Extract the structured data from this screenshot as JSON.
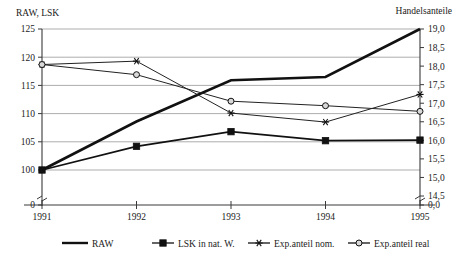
{
  "chart_data": {
    "type": "line",
    "title": "",
    "xlabel": "",
    "ylabel": "RAW, LSK",
    "y2label": "Handelsanteile",
    "grid": true,
    "legend_position": "bottom",
    "categories": [
      "1991",
      "1992",
      "1993",
      "1994",
      "1995"
    ],
    "ylim": [
      100,
      125
    ],
    "y2lim": [
      14.5,
      19.0
    ],
    "yticks": [
      "0",
      "100",
      "105",
      "110",
      "115",
      "120",
      "125"
    ],
    "y2ticks": [
      "0,0",
      "14,5",
      "15,0",
      "15,5",
      "16,0",
      "16,5",
      "17,0",
      "17,5",
      "18,0",
      "18,5",
      "19,0"
    ],
    "axis_break": true,
    "series": [
      {
        "name": "RAW",
        "axis": "left",
        "marker": "none",
        "values": [
          100.0,
          108.6,
          115.9,
          116.5,
          125.0
        ]
      },
      {
        "name": "LSK in nat. W.",
        "axis": "left",
        "marker": "square",
        "values": [
          100.0,
          104.2,
          106.8,
          105.2,
          105.3
        ]
      },
      {
        "name": "Exp.anteil nom.",
        "axis": "right",
        "marker": "star",
        "values": [
          17.95,
          17.97,
          16.32,
          16.02,
          16.95
        ],
        "left_equiv": [
          118.7,
          119.3,
          110.1,
          108.5,
          113.4
        ]
      },
      {
        "name": "Exp.anteil real",
        "axis": "right",
        "marker": "circle",
        "values": [
          17.95,
          17.55,
          16.88,
          16.72,
          16.55
        ],
        "left_equiv": [
          118.7,
          116.9,
          112.2,
          111.4,
          110.4
        ]
      }
    ]
  },
  "left_axis": {
    "title": "RAW, LSK",
    "ticks": [
      {
        "label": "125",
        "value": 125
      },
      {
        "label": "120",
        "value": 120
      },
      {
        "label": "115",
        "value": 115
      },
      {
        "label": "110",
        "value": 110
      },
      {
        "label": "105",
        "value": 105
      },
      {
        "label": "100",
        "value": 100
      },
      {
        "label": "0",
        "value": 0
      }
    ]
  },
  "right_axis": {
    "title": "Handelsanteile",
    "ticks": [
      {
        "label": "19,0",
        "value": 19.0
      },
      {
        "label": "18,5",
        "value": 18.5
      },
      {
        "label": "18,0",
        "value": 18.0
      },
      {
        "label": "17,5",
        "value": 17.5
      },
      {
        "label": "17,0",
        "value": 17.0
      },
      {
        "label": "16,5",
        "value": 16.5
      },
      {
        "label": "16,0",
        "value": 16.0
      },
      {
        "label": "15,5",
        "value": 15.5
      },
      {
        "label": "15,0",
        "value": 15.0
      },
      {
        "label": "14,5",
        "value": 14.5
      },
      {
        "label": "0,0",
        "value": 0
      }
    ]
  },
  "x_axis": {
    "labels": [
      "1991",
      "1992",
      "1993",
      "1994",
      "1995"
    ]
  },
  "legend": {
    "items": [
      {
        "label": "RAW",
        "marker": "line-thick"
      },
      {
        "label": "LSK in nat. W.",
        "marker": "square"
      },
      {
        "label": "Exp.anteil nom.",
        "marker": "star"
      },
      {
        "label": "Exp.anteil real",
        "marker": "circle"
      }
    ]
  }
}
